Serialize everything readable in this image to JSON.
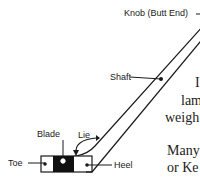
{
  "diagram": {
    "labels": {
      "knob": "Knob (Butt End)",
      "shaft": "Shaft",
      "blade": "Blade",
      "lie": "Lie",
      "toe": "Toe",
      "heel": "Heel"
    },
    "colors": {
      "line": "#1a1a1a",
      "blade_fill": "#111111",
      "background": "#ffffff"
    }
  },
  "text_fragments": [
    {
      "id": "line1",
      "text": "I"
    },
    {
      "id": "line2",
      "text": "lam"
    },
    {
      "id": "line3",
      "text": "weigh"
    },
    {
      "id": "line4",
      "text": "Many"
    },
    {
      "id": "line5",
      "text": "or Ke"
    }
  ]
}
